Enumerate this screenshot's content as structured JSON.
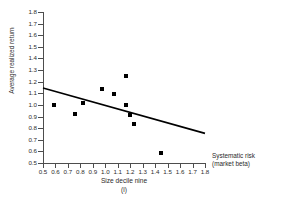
{
  "chart_data": {
    "type": "scatter",
    "title": "",
    "subtitle": "",
    "panel_label": "(i)",
    "xlabel": "Size decile nine",
    "ylabel": "Average realized return",
    "x_axis_note_line1": "Systematic risk",
    "x_axis_note_line2": "(market beta)",
    "xlim": [
      0.5,
      1.8
    ],
    "ylim": [
      0.5,
      1.8
    ],
    "xticks": [
      "0.5",
      "0.6",
      "0.7",
      "0.8",
      "0.9",
      "1.0",
      "1.1",
      "1.2",
      "1.3",
      "1.4",
      "1.5",
      "1.6",
      "1.7",
      "1.8"
    ],
    "yticks": [
      "0.5",
      "0.6",
      "0.7",
      "0.8",
      "0.9",
      "1.0",
      "1.1",
      "1.2",
      "1.3",
      "1.4",
      "1.5",
      "1.6",
      "1.7",
      "1.8"
    ],
    "grid": false,
    "legend": false,
    "marker_color": "#000000",
    "line_color": "#000000",
    "axis_color": "#4d4d4d",
    "points": [
      {
        "x": 0.59,
        "y": 1.0
      },
      {
        "x": 0.76,
        "y": 0.92
      },
      {
        "x": 0.82,
        "y": 1.02
      },
      {
        "x": 0.97,
        "y": 1.14
      },
      {
        "x": 1.07,
        "y": 1.09
      },
      {
        "x": 1.17,
        "y": 1.25
      },
      {
        "x": 1.17,
        "y": 1.0
      },
      {
        "x": 1.2,
        "y": 0.91
      },
      {
        "x": 1.23,
        "y": 0.84
      },
      {
        "x": 1.45,
        "y": 0.59
      }
    ],
    "trendline": {
      "x0": 0.5,
      "y0": 1.145,
      "x1": 1.8,
      "y1": 0.755
    }
  }
}
